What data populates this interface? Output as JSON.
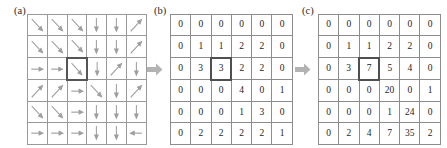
{
  "figure": {
    "panels": [
      {
        "id": "a",
        "label": "(a)",
        "type": "arrow-grid",
        "rows": 6,
        "cols": 6,
        "highlight": {
          "row": 2,
          "col": 2
        },
        "arrows": [
          [
            "down-right",
            "down-right",
            "down-right",
            "down",
            "down",
            "up-right"
          ],
          [
            "down-right",
            "down-right",
            "down-right",
            "down",
            "down",
            "up-right"
          ],
          [
            "right",
            "right",
            "down-right",
            "down",
            "up-right",
            "down"
          ],
          [
            "up-right",
            "up-right",
            "right",
            "down-right",
            "down",
            "up-right"
          ],
          [
            "down-right",
            "down-right",
            "right",
            "down",
            "down",
            "down"
          ],
          [
            "right",
            "right",
            "right",
            "down",
            "down",
            "left"
          ]
        ]
      },
      {
        "id": "b",
        "label": "(b)",
        "type": "number-grid",
        "rows": 6,
        "cols": 6,
        "highlight": {
          "row": 2,
          "col": 2
        },
        "values": [
          [
            "0",
            "0",
            "0",
            "0",
            "0",
            "0"
          ],
          [
            "0",
            "1",
            "1",
            "2",
            "2",
            "0"
          ],
          [
            "0",
            "3",
            "3",
            "2",
            "2",
            "0"
          ],
          [
            "0",
            "0",
            "0",
            "4",
            "0",
            "1"
          ],
          [
            "0",
            "0",
            "0",
            "1",
            "3",
            "0"
          ],
          [
            "0",
            "2",
            "2",
            "2",
            "2",
            "1"
          ]
        ]
      },
      {
        "id": "c",
        "label": "(c)",
        "type": "number-grid",
        "rows": 6,
        "cols": 6,
        "highlight": {
          "row": 2,
          "col": 2
        },
        "values": [
          [
            "0",
            "0",
            "0",
            "0",
            "0",
            "0"
          ],
          [
            "0",
            "1",
            "1",
            "2",
            "2",
            "0"
          ],
          [
            "0",
            "3",
            "7",
            "5",
            "4",
            "0"
          ],
          [
            "0",
            "0",
            "0",
            "20",
            "0",
            "1"
          ],
          [
            "0",
            "0",
            "0",
            "1",
            "24",
            "0"
          ],
          [
            "0",
            "2",
            "4",
            "7",
            "35",
            "2"
          ]
        ]
      }
    ],
    "connectors": [
      {
        "id": "a-to-b",
        "icon": "right-block-arrow-icon"
      },
      {
        "id": "b-to-c",
        "icon": "right-block-arrow-icon"
      }
    ],
    "colors": {
      "grid_line": "#8d8d8d",
      "arrow": "#9e9e9e",
      "highlight_border": "#4f4f4f",
      "connector": "#b3b3b3",
      "text": "#1d1d1d"
    }
  },
  "chart_data": {
    "type": "table",
    "title": "",
    "panels": {
      "a": {
        "description": "gradient orientation arrow grid",
        "directions": [
          [
            "down-right",
            "down-right",
            "down-right",
            "down",
            "down",
            "up-right"
          ],
          [
            "down-right",
            "down-right",
            "down-right",
            "down",
            "down",
            "up-right"
          ],
          [
            "right",
            "right",
            "down-right",
            "down",
            "up-right",
            "down"
          ],
          [
            "up-right",
            "up-right",
            "right",
            "down-right",
            "down",
            "up-right"
          ],
          [
            "down-right",
            "down-right",
            "right",
            "down",
            "down",
            "down"
          ],
          [
            "right",
            "right",
            "right",
            "down",
            "down",
            "left"
          ]
        ]
      },
      "b": {
        "description": "magnitude values",
        "values": [
          [
            0,
            0,
            0,
            0,
            0,
            0
          ],
          [
            0,
            1,
            1,
            2,
            2,
            0
          ],
          [
            0,
            3,
            3,
            2,
            2,
            0
          ],
          [
            0,
            0,
            0,
            4,
            0,
            1
          ],
          [
            0,
            0,
            0,
            1,
            3,
            0
          ],
          [
            0,
            2,
            2,
            2,
            2,
            1
          ]
        ]
      },
      "c": {
        "description": "accumulated values",
        "values": [
          [
            0,
            0,
            0,
            0,
            0,
            0
          ],
          [
            0,
            1,
            1,
            2,
            2,
            0
          ],
          [
            0,
            3,
            7,
            5,
            4,
            0
          ],
          [
            0,
            0,
            0,
            20,
            0,
            1
          ],
          [
            0,
            0,
            0,
            1,
            24,
            0
          ],
          [
            0,
            2,
            4,
            7,
            35,
            2
          ]
        ]
      }
    }
  }
}
